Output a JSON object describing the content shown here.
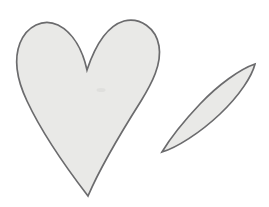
{
  "scene": {
    "title": "Hand-drawn heart and leaf outline illustration",
    "background_color": "#ffffff",
    "width": 269,
    "height": 207,
    "medium": "line drawing",
    "shape_count": 2
  },
  "style": {
    "fill_color": "#e9e9e7",
    "stroke_color": "#6b6b6d",
    "stroke_width": 1.7,
    "smudge_color": "#c9c9c7"
  },
  "shapes": [
    {
      "id": "heart",
      "label": "heart",
      "description": "Large hand-drawn heart with two rounded lobes, a central cleft, and a sharp bottom point, tilted slightly to the right.",
      "bbox": {
        "x": 16,
        "y": 19,
        "width": 146,
        "height": 178
      },
      "key_points": {
        "left_lobe_top": [
          45,
          22
        ],
        "right_lobe_top": [
          130,
          20
        ],
        "cleft_bottom": [
          87,
          70
        ],
        "leftmost": [
          17,
          72
        ],
        "rightmost": [
          160,
          46
        ],
        "bottom_tip": [
          88,
          196
        ]
      },
      "path": "M 87 70 C 83 52 74 33 58 25 C 43 18 27 26 20 43 C 13 61 18 82 27 101 C 42 133 68 170 88 196 C 100 168 122 131 141 101 C 152 83 162 64 159 46 C 156 28 140 17 124 21 C 107 26 95 46 87 70 Z"
    },
    {
      "id": "leaf",
      "label": "leaf",
      "description": "Narrow elongated lens or leaf shape tilted about 45 degrees, pointed at both ends, located to the right of the heart.",
      "bbox": {
        "x": 161,
        "y": 63,
        "width": 95,
        "height": 90
      },
      "key_points": {
        "top_right_tip": [
          255,
          64
        ],
        "bottom_left_tip": [
          162,
          152
        ],
        "widest_span": 28
      },
      "path": "M 255 64 C 240 69 218 85 200 104 C 182 123 168 142 162 152 C 176 148 200 133 220 114 C 240 95 252 76 255 64 Z"
    }
  ],
  "marks": [
    {
      "id": "interior-smudge",
      "label": "faint pencil smudge",
      "description": "Very faint light gray mark inside the heart near the centre.",
      "position": [
        101,
        90
      ],
      "width": 9,
      "height": 4
    }
  ]
}
